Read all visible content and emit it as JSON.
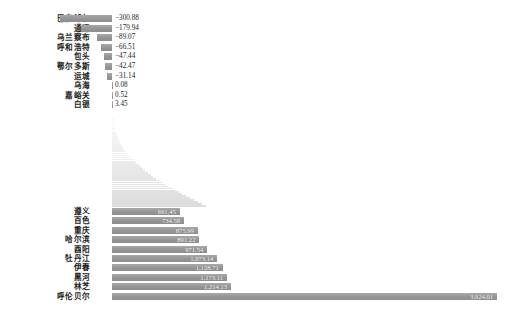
{
  "chart_data": {
    "type": "bar",
    "orientation": "horizontal",
    "title": "",
    "subtitle": "",
    "xlabel": "",
    "ylabel": "",
    "grid": false,
    "legend": "none",
    "note": "Horizontal bar chart with elided middle section; top group shows the most negative values, bottom group shows the largest positive values.",
    "xlim": [
      -300.88,
      3924.01
    ],
    "bar_color": "#9a9a9a",
    "groups": [
      {
        "name": "top-negative",
        "categories": [
          "巴彦淖尔",
          "通辽",
          "乌兰察布",
          "呼和浩特",
          "包头",
          "鄂尔多斯",
          "运城",
          "乌海",
          "嘉峪关",
          "白银"
        ],
        "values": [
          -300.88,
          -179.94,
          -89.07,
          -66.51,
          -47.44,
          -42.47,
          -31.14,
          0.08,
          0.52,
          3.45
        ],
        "value_labels": [
          "−300.88",
          "−179.94",
          "−89.07",
          "−66.51",
          "−47.44",
          "−42.47",
          "−31.14",
          "0.08",
          "0.52",
          "3.45"
        ]
      },
      {
        "name": "bottom-positive",
        "categories": [
          "遵义",
          "百色",
          "重庆",
          "哈尔滨",
          "酉阳",
          "牡丹江",
          "伊春",
          "黑河",
          "林芝",
          "呼伦贝尔"
        ],
        "values": [
          691.45,
          734.58,
          875.99,
          891.22,
          971.54,
          1073.14,
          1128.71,
          1173.11,
          1214.13,
          3924.01
        ],
        "value_labels": [
          "691.45",
          "734.58",
          "875.99",
          "891.22",
          "971.54",
          "1,073.14",
          "1,128.71",
          "1,173.11",
          "1,214.13",
          "3,924.01"
        ]
      }
    ],
    "elided_middle": {
      "shown": true,
      "description": "faint tapering fan of omitted intermediate bars"
    }
  },
  "caption": {
    "text": ""
  }
}
